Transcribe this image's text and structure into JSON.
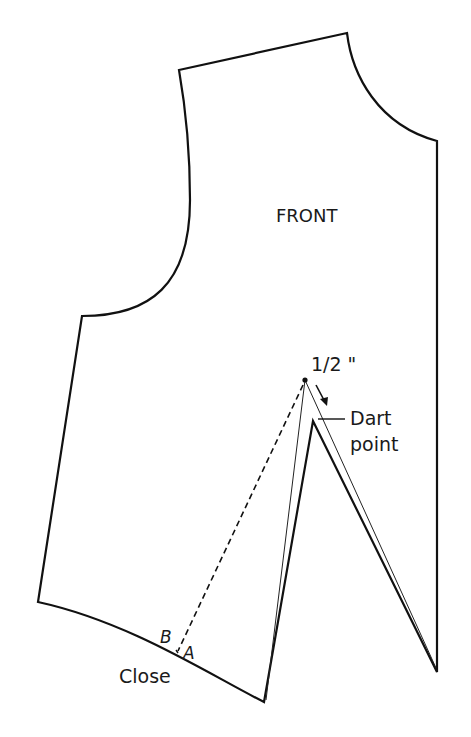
{
  "diagram": {
    "type": "sewing-pattern",
    "piece_label": "FRONT",
    "measurement_label": "1/2 \"",
    "dart_label_line1": "Dart",
    "dart_label_line2": "point",
    "point_b_label": "B",
    "point_a_label": "A",
    "close_label": "Close",
    "colors": {
      "stroke": "#111111",
      "background": "#ffffff"
    }
  }
}
